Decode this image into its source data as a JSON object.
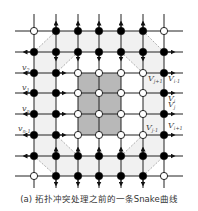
{
  "figure": {
    "caption": "(a) 拓扑冲突处理之前的一条Snake曲线",
    "grid": {
      "columns_x": [
        34,
        56,
        78,
        99,
        121,
        143,
        164
      ],
      "rows_y": [
        31,
        52,
        73,
        93,
        114,
        135,
        156,
        176
      ],
      "line_extent": {
        "x_min": 15,
        "x_max": 183,
        "y_min": 14,
        "y_max": 188
      }
    },
    "colors": {
      "line": "#222222",
      "node_filled": "#000000",
      "node_open_fill": "#ffffff",
      "region_inner": "#b8b8b8",
      "region_band": "#f0f0f0",
      "snake_dash": "#999999"
    },
    "labels": [
      {
        "text": "v",
        "sub": "2",
        "x": 22,
        "y": 70
      },
      {
        "text": "v",
        "sub": "1",
        "x": 22,
        "y": 90
      },
      {
        "text": "v",
        "sub": "n",
        "x": 22,
        "y": 111
      },
      {
        "text": "v",
        "sub": "n-1",
        "x": 18,
        "y": 131
      },
      {
        "text": "V",
        "sub": "j+1",
        "x": 148,
        "y": 81
      },
      {
        "text": "V",
        "sub": "i-1",
        "x": 168,
        "y": 81
      },
      {
        "text": "V",
        "sub": "i",
        "x": 168,
        "y": 101
      },
      {
        "text": "V",
        "sub": "j",
        "x": 168,
        "y": 107
      },
      {
        "text": "V",
        "sub": "j-1",
        "x": 146,
        "y": 130
      },
      {
        "text": "V",
        "sub": "i+1",
        "x": 168,
        "y": 128
      }
    ]
  }
}
